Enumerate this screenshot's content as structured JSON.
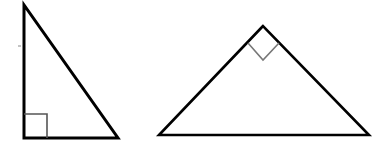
{
  "diagram": {
    "title": "",
    "background": "#ffffff",
    "stroke_color": "#000000",
    "marker_color_left": "#555555",
    "marker_color_right": "#777777",
    "shapes": [
      {
        "name": "right-triangle-left",
        "type": "right-triangle",
        "vertices": [
          [
            24,
            5
          ],
          [
            24,
            138
          ],
          [
            118,
            138
          ]
        ],
        "right_angle_vertex": [
          24,
          138
        ],
        "right_angle_marker": [
          [
            24,
            114
          ],
          [
            47,
            114
          ],
          [
            47,
            138
          ]
        ]
      },
      {
        "name": "right-triangle-right",
        "type": "right-triangle",
        "vertices": [
          [
            263,
            26
          ],
          [
            159,
            135
          ],
          [
            369,
            135
          ]
        ],
        "right_angle_vertex": [
          263,
          26
        ],
        "right_angle_marker": [
          [
            248,
            43
          ],
          [
            263,
            60
          ],
          [
            279,
            43
          ]
        ]
      }
    ],
    "labels": []
  }
}
